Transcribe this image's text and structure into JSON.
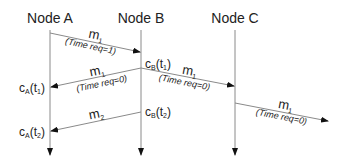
{
  "diagram": {
    "type": "sequence-diagram",
    "nodes": [
      {
        "id": "A",
        "label": "Node A"
      },
      {
        "id": "B",
        "label": "Node B"
      },
      {
        "id": "C",
        "label": "Node C"
      }
    ],
    "messages": [
      {
        "from": "A",
        "to": "B",
        "label": "m",
        "sub": "1",
        "note": "(Time req=1)"
      },
      {
        "from": "B",
        "to": "A",
        "label": "m",
        "sub": "1",
        "note": "(Time req=0)"
      },
      {
        "from": "B",
        "to": "C",
        "label": "m",
        "sub": "1",
        "note": "(Time req=0)"
      },
      {
        "from": "C",
        "to": "off-right",
        "label": "m",
        "sub": "1",
        "note": "(Time req=0)"
      },
      {
        "from": "B",
        "to": "A",
        "label": "m",
        "sub": "2",
        "note": ""
      }
    ],
    "clocks": [
      {
        "node": "B",
        "c": "c",
        "node_sub": "B",
        "t": "t",
        "t_sub": "1",
        "text_open": "(",
        "text_close": ")"
      },
      {
        "node": "A",
        "c": "c",
        "node_sub": "A",
        "t": "t",
        "t_sub": "1",
        "text_open": "(",
        "text_close": ")"
      },
      {
        "node": "B",
        "c": "c",
        "node_sub": "B",
        "t": "t",
        "t_sub": "2",
        "text_open": "(",
        "text_close": ")"
      },
      {
        "node": "A",
        "c": "c",
        "node_sub": "A",
        "t": "t",
        "t_sub": "2",
        "text_open": "(",
        "text_close": ")"
      }
    ]
  }
}
